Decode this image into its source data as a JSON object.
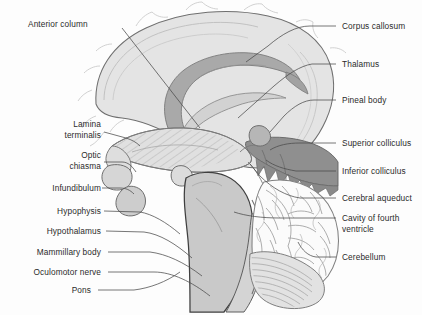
{
  "figure": {
    "background_color": "#fdfdfd",
    "width": 422,
    "height": 315
  },
  "palette": {
    "outline": "#6f6f6f",
    "brain_fill": "#e4e4e4",
    "cortex_fill": "#dcdcdc",
    "corpus_callosum_fill": "#a9a9a9",
    "tectum_fill": "#8f8f8f",
    "brainstem_fill": "#cfcfcf",
    "cerebellum_fill": "#fbfbfb",
    "hatch_stroke": "#b4b4b4",
    "leader_line": "#4a4a4a",
    "text_color": "#2b2b2b"
  },
  "labels": {
    "left": [
      {
        "id": "anterior-column",
        "text": "Anterior column",
        "x": 28,
        "y": 24,
        "align": "left",
        "wrap": false
      },
      {
        "id": "lamina-terminalis",
        "text": "Lamina\nterminalis",
        "line1": "Lamina",
        "line2": "terminalis",
        "x": 59,
        "y": 124,
        "align": "right",
        "wrap": true
      },
      {
        "id": "optic-chiasma",
        "text": "Optic\nchiasma",
        "line1": "Optic",
        "line2": "chiasma",
        "x": 59,
        "y": 155,
        "align": "right",
        "wrap": true
      },
      {
        "id": "infundibulum",
        "text": "Infundibulum",
        "x": 40,
        "y": 187,
        "align": "right",
        "wrap": false
      },
      {
        "id": "hypophysis",
        "text": "Hypophysis",
        "x": 47,
        "y": 210,
        "align": "right",
        "wrap": false
      },
      {
        "id": "hypothalamus",
        "text": "Hypothalamus",
        "x": 36,
        "y": 230,
        "align": "right",
        "wrap": false
      },
      {
        "id": "mammillary-body",
        "text": "Mammillary body",
        "x": 26,
        "y": 251,
        "align": "right",
        "wrap": false
      },
      {
        "id": "oculomotor-nerve",
        "text": "Oculomotor nerve",
        "x": 23,
        "y": 271,
        "align": "right",
        "wrap": false
      },
      {
        "id": "pons",
        "text": "Pons",
        "x": 72,
        "y": 289,
        "align": "right",
        "wrap": false
      }
    ],
    "right": [
      {
        "id": "corpus-callosum",
        "text": "Corpus callosum",
        "x": 340,
        "y": 22,
        "align": "left",
        "wrap": false
      },
      {
        "id": "thalamus",
        "text": "Thalamus",
        "x": 340,
        "y": 60,
        "align": "left",
        "wrap": false
      },
      {
        "id": "pineal-body",
        "text": "Pineal body",
        "x": 340,
        "y": 96,
        "align": "left",
        "wrap": false
      },
      {
        "id": "superior-colliculus",
        "text": "Superior colliculus",
        "x": 340,
        "y": 139,
        "align": "left",
        "wrap": false
      },
      {
        "id": "inferior-colliculus",
        "text": "Inferior colliculus",
        "x": 340,
        "y": 167,
        "align": "left",
        "wrap": false
      },
      {
        "id": "cerebral-aqueduct",
        "text": "Cerebral aqueduct",
        "x": 340,
        "y": 194,
        "align": "left",
        "wrap": false
      },
      {
        "id": "cavity-of-fourth-ventricle",
        "text": "Cavity of fourth\nventricle",
        "line1": "Cavity of fourth",
        "line2": "ventricle",
        "x": 340,
        "y": 220,
        "align": "left",
        "wrap": true
      },
      {
        "id": "cerebellum",
        "text": "Cerebellum",
        "x": 340,
        "y": 253,
        "align": "left",
        "wrap": false
      }
    ]
  },
  "structures": [
    {
      "id": "cerebral-hemisphere",
      "name": "Cerebral hemisphere (medial surface)"
    },
    {
      "id": "corpus-callosum-band",
      "name": "Corpus callosum"
    },
    {
      "id": "fornix",
      "name": "Fornix / anterior column"
    },
    {
      "id": "thalamus-hatched",
      "name": "Thalamus and hypothalamus (hatched)"
    },
    {
      "id": "optic-chiasma-shape",
      "name": "Optic chiasma"
    },
    {
      "id": "hypophysis-shape",
      "name": "Hypophysis (pituitary gland)"
    },
    {
      "id": "mammillary-body-shape",
      "name": "Mammillary body"
    },
    {
      "id": "tectum",
      "name": "Tectum: superior and inferior colliculi"
    },
    {
      "id": "pineal-body-shape",
      "name": "Pineal body"
    },
    {
      "id": "pons-shape",
      "name": "Pons"
    },
    {
      "id": "medulla",
      "name": "Medulla oblongata"
    },
    {
      "id": "cerebellum-shape",
      "name": "Cerebellum with arbor vitae"
    },
    {
      "id": "fourth-ventricle",
      "name": "Cavity of fourth ventricle"
    }
  ]
}
